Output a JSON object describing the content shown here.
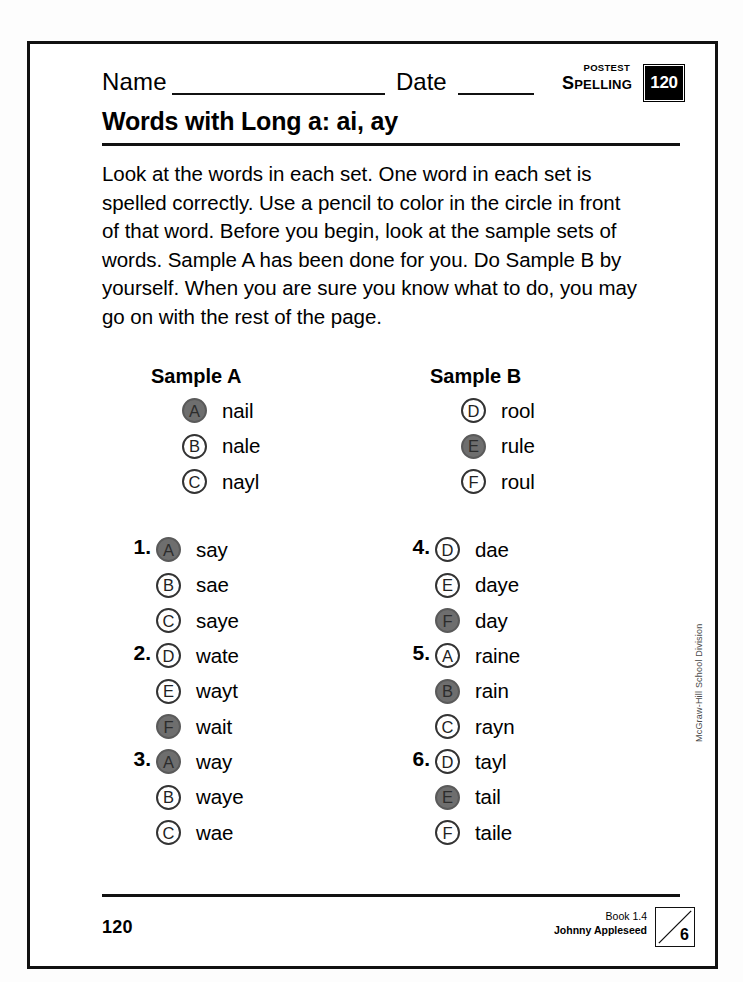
{
  "header": {
    "name_label": "Name",
    "date_label": "Date",
    "postest_label": "POSTEST",
    "subject_label": "Spelling",
    "unit_badge": "120"
  },
  "title": "Words with Long a: ai, ay",
  "instructions": "Look at the words in each set. One word in each set is spelled correctly. Use a pencil to color in the circle in front of that word. Before you begin, look at the sample sets of words. Sample A has been done for you. Do Sample B by yourself. When you are sure you know what to do, you may go on with the rest of the page.",
  "samples": {
    "a": {
      "heading": "Sample A",
      "options": [
        {
          "letter": "A",
          "word": "nail",
          "filled": true
        },
        {
          "letter": "B",
          "word": "nale",
          "filled": false
        },
        {
          "letter": "C",
          "word": "nayl",
          "filled": false
        }
      ]
    },
    "b": {
      "heading": "Sample B",
      "options": [
        {
          "letter": "D",
          "word": "rool",
          "filled": false
        },
        {
          "letter": "E",
          "word": "rule",
          "filled": true
        },
        {
          "letter": "F",
          "word": "roul",
          "filled": false
        }
      ]
    }
  },
  "questions": [
    {
      "number": "1.",
      "options": [
        {
          "letter": "A",
          "word": "say",
          "filled": true
        },
        {
          "letter": "B",
          "word": "sae",
          "filled": false
        },
        {
          "letter": "C",
          "word": "saye",
          "filled": false
        }
      ]
    },
    {
      "number": "2.",
      "options": [
        {
          "letter": "D",
          "word": "wate",
          "filled": false
        },
        {
          "letter": "E",
          "word": "wayt",
          "filled": false
        },
        {
          "letter": "F",
          "word": "wait",
          "filled": true
        }
      ]
    },
    {
      "number": "3.",
      "options": [
        {
          "letter": "A",
          "word": "way",
          "filled": true
        },
        {
          "letter": "B",
          "word": "waye",
          "filled": false
        },
        {
          "letter": "C",
          "word": "wae",
          "filled": false
        }
      ]
    },
    {
      "number": "4.",
      "options": [
        {
          "letter": "D",
          "word": "dae",
          "filled": false
        },
        {
          "letter": "E",
          "word": "daye",
          "filled": false
        },
        {
          "letter": "F",
          "word": "day",
          "filled": true
        }
      ]
    },
    {
      "number": "5.",
      "options": [
        {
          "letter": "A",
          "word": "raine",
          "filled": false
        },
        {
          "letter": "B",
          "word": "rain",
          "filled": true
        },
        {
          "letter": "C",
          "word": "rayn",
          "filled": false
        }
      ]
    },
    {
      "number": "6.",
      "options": [
        {
          "letter": "D",
          "word": "tayl",
          "filled": false
        },
        {
          "letter": "E",
          "word": "tail",
          "filled": true
        },
        {
          "letter": "F",
          "word": "taile",
          "filled": false
        }
      ]
    }
  ],
  "footer": {
    "page_number": "120",
    "book_line": "Book 1.4",
    "story_line": "Johnny Appleseed",
    "unit_number": "6"
  },
  "side_credit": "McGraw-Hill School Division",
  "colors": {
    "ink": "#111111",
    "filled_bubble": "#6e6e6e",
    "badge_background": "#000000"
  }
}
